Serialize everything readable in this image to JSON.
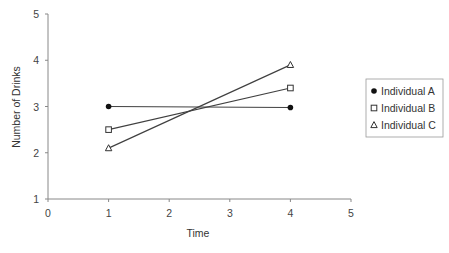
{
  "chart_data": {
    "type": "line",
    "title": "",
    "xlabel": "Time",
    "ylabel": "Number of Drinks",
    "xlim": [
      0,
      5
    ],
    "ylim": [
      1,
      5
    ],
    "xticks": [
      "0",
      "1",
      "2",
      "3",
      "4",
      "5"
    ],
    "yticks": [
      "1",
      "2",
      "3",
      "4",
      "5"
    ],
    "grid": false,
    "legend_position": "right",
    "series": [
      {
        "name": "Individual A",
        "marker": "filled-circle",
        "x": [
          1,
          4
        ],
        "y": [
          3.0,
          2.98
        ]
      },
      {
        "name": "Individual B",
        "marker": "open-square",
        "x": [
          1,
          4
        ],
        "y": [
          2.5,
          3.4
        ]
      },
      {
        "name": "Individual C",
        "marker": "open-triangle",
        "x": [
          1,
          4
        ],
        "y": [
          2.1,
          3.9
        ]
      }
    ]
  },
  "colors": {
    "line": "#404040",
    "axis": "#888888",
    "legend_border": "#999999"
  }
}
